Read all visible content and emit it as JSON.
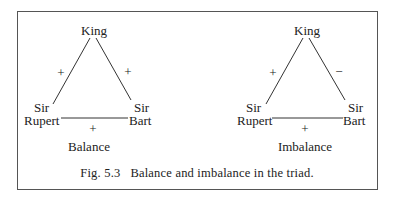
{
  "figure": {
    "caption": "Fig. 5.3   Balance and imbalance in the triad.",
    "panels": [
      {
        "label": "Balance",
        "nodes": {
          "top": "King",
          "left_line1": "Sir",
          "left_line2": "Rupert",
          "right_line1": "Sir",
          "right_line2": "Bart"
        },
        "edges": {
          "king_rupert": "+",
          "king_bart": "+",
          "rupert_bart": "+"
        }
      },
      {
        "label": "Imbalance",
        "nodes": {
          "top": "King",
          "left_line1": "Sir",
          "left_line2": "Rupert",
          "right_line1": "Sir",
          "right_line2": "Bart"
        },
        "edges": {
          "king_rupert": "+",
          "king_bart": "−",
          "rupert_bart": "+"
        }
      }
    ]
  }
}
